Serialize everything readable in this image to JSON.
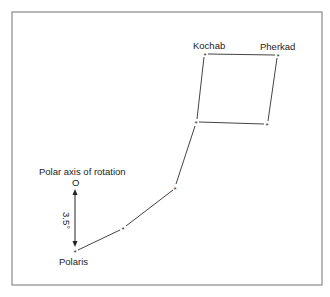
{
  "diagram": {
    "stars": [
      {
        "name": "Kochab",
        "label": "Kochab"
      },
      {
        "name": "Pherkad",
        "label": "Pherkad"
      },
      {
        "name": "Polaris",
        "label": "Polaris"
      }
    ],
    "axis_label": "Polar axis of rotation",
    "axis_marker": "O",
    "angle_label": "3.5°",
    "colors": {
      "frame": "#8a8a8a",
      "line": "#444444",
      "text": "#222222"
    }
  }
}
